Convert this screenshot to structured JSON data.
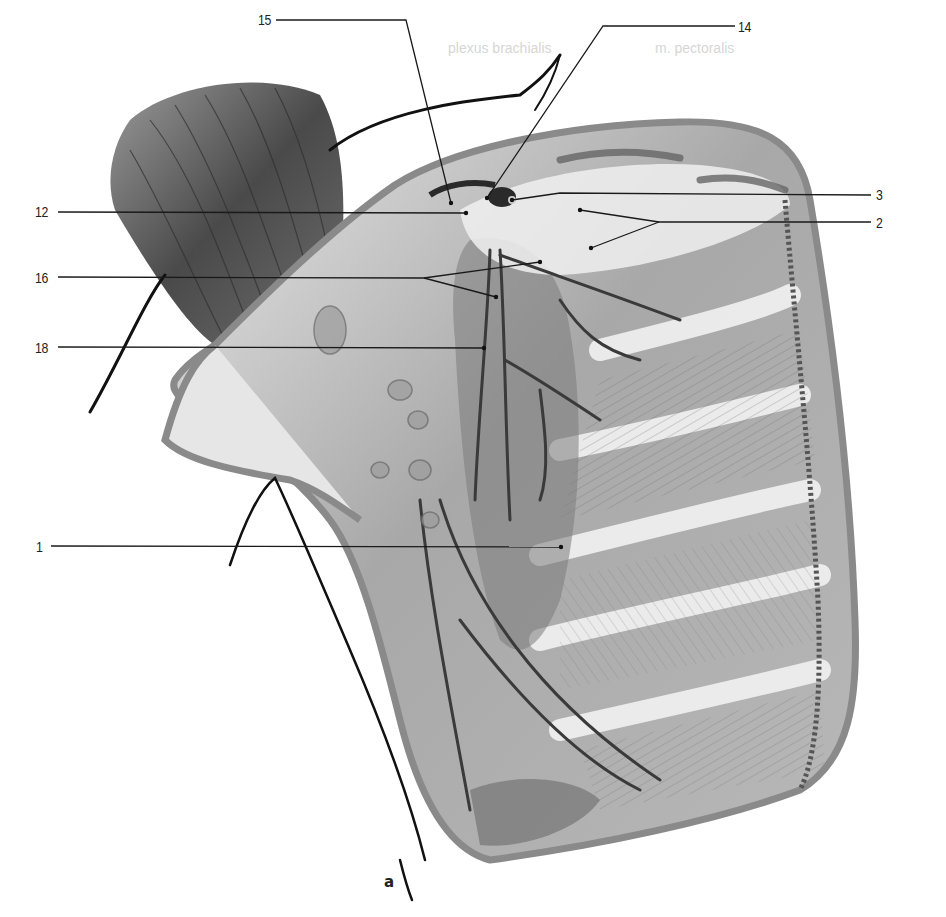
{
  "figure": {
    "panel_letter": "a",
    "ghost_text": [
      "plexus brachialis",
      "m. pectoralis"
    ],
    "colors": {
      "ink": "#222222",
      "skin_outline": "#111111",
      "cut_edge": "#8a8a8a",
      "muscle_dark": "#4a4a4a",
      "muscle_mid": "#8c8c8c",
      "fascia_light": "#e4e4e4",
      "background": "#ffffff"
    },
    "labels": [
      {
        "id": "15",
        "text": "15",
        "x": 258,
        "y": 12,
        "line": [
          [
            276,
            20
          ],
          [
            406,
            20
          ],
          [
            451,
            203
          ]
        ]
      },
      {
        "id": "14",
        "text": "14",
        "x": 738,
        "y": 19,
        "line": [
          [
            735,
            26
          ],
          [
            603,
            26
          ],
          [
            487,
            198
          ]
        ]
      },
      {
        "id": "12",
        "text": "12",
        "x": 35,
        "y": 204,
        "line": [
          [
            58,
            212
          ],
          [
            466,
            213
          ]
        ]
      },
      {
        "id": "3",
        "text": "3",
        "x": 876,
        "y": 187,
        "line": [
          [
            871,
            195
          ],
          [
            560,
            193
          ],
          [
            512,
            200
          ]
        ]
      },
      {
        "id": "2",
        "text": "2",
        "x": 876,
        "y": 215,
        "line": [
          [
            871,
            222
          ],
          [
            659,
            222
          ],
          [
            580,
            210
          ]
        ],
        "branch": [
          [
            659,
            222
          ],
          [
            591,
            248
          ]
        ]
      },
      {
        "id": "16",
        "text": "16",
        "x": 35,
        "y": 270,
        "line": [
          [
            58,
            277
          ],
          [
            424,
            278
          ],
          [
            540,
            262
          ]
        ],
        "branch": [
          [
            424,
            278
          ],
          [
            496,
            297
          ]
        ]
      },
      {
        "id": "18",
        "text": "18",
        "x": 35,
        "y": 340,
        "line": [
          [
            58,
            347
          ],
          [
            484,
            348
          ]
        ]
      },
      {
        "id": "1",
        "text": "1",
        "x": 36,
        "y": 540,
        "line": [
          [
            51,
            546
          ],
          [
            561,
            547
          ]
        ]
      }
    ]
  }
}
